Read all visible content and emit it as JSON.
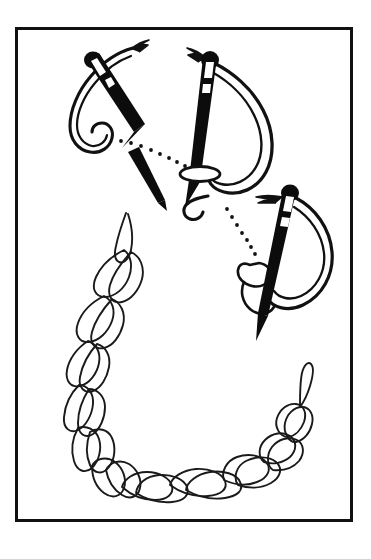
{
  "document": {
    "type": "illustration",
    "subject": "Embroidery twisted chain stitch instruction diagram",
    "title": "",
    "caption": "",
    "background_color": "#ffffff",
    "ink_color": "#000000",
    "border_color": "#111111",
    "page_width": 371,
    "page_height": 559
  },
  "frame": {
    "name": "illustration-border",
    "x": 15,
    "y": 27,
    "width": 338,
    "height": 495,
    "stroke_width": 3,
    "color": "#111111"
  },
  "figure": {
    "element_count": 4,
    "steps": [
      {
        "id": "step-1",
        "label": "",
        "name": "needle-step-one",
        "description": "Needle entering fabric with thread loop held under point, upper left",
        "needle_angle_deg": 28,
        "needle_x": 112,
        "needle_y": 110,
        "eye_color": "#000000"
      },
      {
        "id": "step-2",
        "label": "",
        "name": "needle-step-two",
        "description": "Needle pulled through forming twisted loop, upper center",
        "needle_angle_deg": 12,
        "needle_x": 212,
        "needle_y": 125,
        "eye_color": "#000000"
      },
      {
        "id": "step-3",
        "label": "",
        "name": "needle-step-three",
        "description": "Needle re-entering to lock the chain loop, right side",
        "needle_angle_deg": 8,
        "needle_x": 282,
        "needle_y": 255,
        "eye_color": "#000000"
      },
      {
        "id": "step-4",
        "label": "",
        "name": "finished-braided-chain",
        "description": "Completed twisted chain stitch row forming an open loop",
        "stroke_color": "#1a1a1a"
      }
    ],
    "motion_guides": [
      {
        "name": "dotted-guide-one",
        "from": [
          122,
          145
        ],
        "to": [
          180,
          165
        ],
        "dot_count": 8,
        "style": "dotted"
      },
      {
        "name": "dotted-guide-two",
        "from": [
          222,
          203
        ],
        "to": [
          258,
          245
        ],
        "dot_count": 7,
        "style": "dotted"
      }
    ],
    "fabric_marks": [
      {
        "name": "stitch-hole-mark",
        "x": 183,
        "y": 174,
        "width": 36,
        "height": 13
      }
    ]
  },
  "chart_data": {
    "type": "table",
    "categories": [
      "Step 1",
      "Step 2",
      "Step 3",
      "Finished row"
    ],
    "values": [
      1,
      2,
      3,
      4
    ],
    "xlabel": "",
    "ylabel": "",
    "annotations": [
      "Needle enters and thread loops beneath the point",
      "Needle draws the twisted loop taut over the stitch hole",
      "Needle pierces again to lock the previous loop",
      "Completed braided chain forms a continuous loop"
    ]
  }
}
